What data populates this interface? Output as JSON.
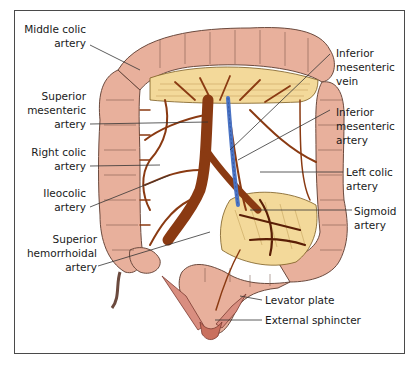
{
  "figure": {
    "colors": {
      "colon": "#e8b09c",
      "colon_outline": "#6b4a3e",
      "mesentery": "#f3d99a",
      "artery": "#8a3a12",
      "artery_dark": "#5a1e06",
      "vein": "#4a73c4",
      "frame": "#4a4a4a",
      "leader": "#333333"
    },
    "labels_left": [
      {
        "id": "middle-colic-artery",
        "lines": [
          "Middle colic",
          "artery"
        ]
      },
      {
        "id": "superior-mesenteric-artery",
        "lines": [
          "Superior",
          "mesenteric",
          "artery"
        ]
      },
      {
        "id": "right-colic-artery",
        "lines": [
          "Right colic",
          "artery"
        ]
      },
      {
        "id": "ileocolic-artery",
        "lines": [
          "Ileocolic",
          "artery"
        ]
      },
      {
        "id": "superior-hemorrhoidal-artery",
        "lines": [
          "Superior",
          "hemorrhoidal",
          "artery"
        ]
      }
    ],
    "labels_right": [
      {
        "id": "inferior-mesenteric-vein",
        "lines": [
          "Inferior",
          "mesenteric",
          "vein"
        ]
      },
      {
        "id": "inferior-mesenteric-artery",
        "lines": [
          "Inferior",
          "mesenteric",
          "artery"
        ]
      },
      {
        "id": "left-colic-artery",
        "lines": [
          "Left colic",
          "artery"
        ]
      },
      {
        "id": "sigmoid-artery",
        "lines": [
          "Sigmoid",
          "artery"
        ]
      },
      {
        "id": "levator-plate",
        "lines": [
          "Levator plate"
        ]
      },
      {
        "id": "external-sphincter",
        "lines": [
          "External sphincter"
        ]
      }
    ]
  }
}
